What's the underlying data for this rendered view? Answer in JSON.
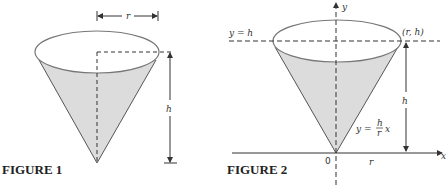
{
  "figure1": {
    "caption": "FIGURE 1",
    "labels": {
      "radius": "r",
      "height": "h"
    }
  },
  "figure2": {
    "caption": "FIGURE 2",
    "labels": {
      "y_axis": "y",
      "x_axis": "x",
      "origin": "0",
      "line_y_eq_h": "y = h",
      "point": "(r, h)",
      "height": "h",
      "radius": "r",
      "eq_lhs": "y =",
      "eq_num": "h",
      "eq_den": "r",
      "eq_var": "x"
    }
  },
  "colors": {
    "fill": "#dcdcdc",
    "stroke": "#555555"
  }
}
